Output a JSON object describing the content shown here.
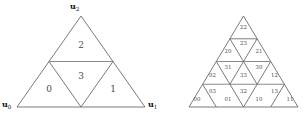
{
  "figure": {
    "background_color": "#ffffff",
    "line_color": "#6b6b6b",
    "accent_line_color": "#8c8c8c",
    "label_color": "#4a4a4a",
    "vertex_label_color": "#111111"
  },
  "left_triangle": {
    "name": "order-1-subdivided-triangle",
    "vertices": [
      {
        "id": "u0",
        "base": "u",
        "sub": "0",
        "position": "bottom-left"
      },
      {
        "id": "u1",
        "base": "u",
        "sub": "1",
        "position": "bottom-right"
      },
      {
        "id": "u2",
        "base": "u",
        "sub": "2",
        "position": "top-apex"
      }
    ],
    "cells": [
      {
        "label": "0",
        "position": "bottom-left",
        "orientation": "up",
        "cx": 49,
        "cy": 89
      },
      {
        "label": "1",
        "position": "bottom-right",
        "orientation": "up",
        "cx": 113,
        "cy": 89
      },
      {
        "label": "2",
        "position": "top",
        "orientation": "up",
        "cx": 81,
        "cy": 45
      },
      {
        "label": "3",
        "position": "center",
        "orientation": "down",
        "cx": 81,
        "cy": 76
      }
    ]
  },
  "right_triangle": {
    "name": "order-2-subdivided-triangle",
    "rows": [
      {
        "row": 1,
        "cells": [
          {
            "label": "22",
            "orientation": "up",
            "cx": 243.5,
            "cy": 28
          }
        ]
      },
      {
        "row": 2,
        "cells": [
          {
            "label": "20",
            "orientation": "up",
            "cx": 228.0,
            "cy": 52
          },
          {
            "label": "23",
            "orientation": "down",
            "cx": 243.5,
            "cy": 44
          },
          {
            "label": "21",
            "orientation": "up",
            "cx": 259.0,
            "cy": 52
          }
        ]
      },
      {
        "row": 3,
        "cells": [
          {
            "label": "02",
            "orientation": "up",
            "cx": 212.5,
            "cy": 76
          },
          {
            "label": "31",
            "orientation": "down",
            "cx": 228.0,
            "cy": 68
          },
          {
            "label": "33",
            "orientation": "up",
            "cx": 243.5,
            "cy": 76
          },
          {
            "label": "30",
            "orientation": "down",
            "cx": 259.0,
            "cy": 68
          },
          {
            "label": "12",
            "orientation": "up",
            "cx": 274.5,
            "cy": 76
          }
        ]
      },
      {
        "row": 4,
        "cells": [
          {
            "label": "00",
            "orientation": "up",
            "cx": 197.0,
            "cy": 100
          },
          {
            "label": "03",
            "orientation": "down",
            "cx": 212.5,
            "cy": 92
          },
          {
            "label": "01",
            "orientation": "up",
            "cx": 228.0,
            "cy": 100
          },
          {
            "label": "32",
            "orientation": "down",
            "cx": 243.5,
            "cy": 92
          },
          {
            "label": "10",
            "orientation": "up",
            "cx": 259.0,
            "cy": 100
          },
          {
            "label": "13",
            "orientation": "down",
            "cx": 274.5,
            "cy": 92
          },
          {
            "label": "11",
            "orientation": "up",
            "cx": 290.0,
            "cy": 100
          }
        ]
      }
    ]
  }
}
